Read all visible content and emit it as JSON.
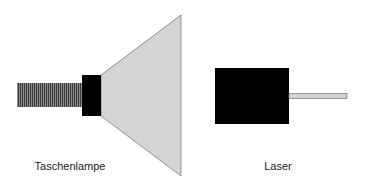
{
  "labels": {
    "flashlight": "Taschenlampe",
    "laser": "Laser"
  },
  "colors": {
    "body": "#000000",
    "handle_stripe_dark": "#3a3a3a",
    "handle_stripe_light": "#8a8a8a",
    "cone_fill": "#d4d4d4",
    "cone_stroke": "#7a7a7a",
    "beam_fill": "#d0d0d0",
    "beam_stroke": "#777777"
  }
}
